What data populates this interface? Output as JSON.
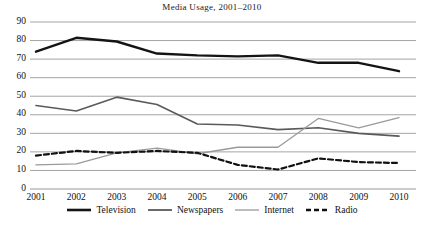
{
  "chart_data": {
    "type": "line",
    "title": "Media  Usage, 2001–2010",
    "xlabel": "",
    "ylabel": "",
    "x": [
      2001,
      2002,
      2003,
      2004,
      2005,
      2006,
      2007,
      2008,
      2009,
      2010
    ],
    "categories": [
      "2001",
      "2002",
      "2003",
      "2004",
      "2005",
      "2006",
      "2007",
      "2008",
      "2009",
      "2010"
    ],
    "xlim": [
      2001,
      2010
    ],
    "ylim": [
      0,
      90
    ],
    "yticks": [
      0,
      10,
      20,
      30,
      40,
      50,
      60,
      70,
      80,
      90
    ],
    "ytick_labels": [
      "0",
      "10",
      "20",
      "30",
      "40",
      "50",
      "60",
      "70",
      "80",
      "90"
    ],
    "grid": "horizontal",
    "legend_position": "bottom",
    "series": [
      {
        "name": "Television",
        "values": [
          74,
          81.5,
          79.5,
          73,
          72,
          71.5,
          72,
          68,
          68,
          63.5
        ],
        "color": "#141414",
        "width": 2.4,
        "dash": "none"
      },
      {
        "name": "Newspapers",
        "values": [
          45,
          42,
          49.5,
          45.5,
          35,
          34.5,
          32,
          33,
          30,
          28.5
        ],
        "color": "#5a5a5a",
        "width": 1.6,
        "dash": "none"
      },
      {
        "name": "Internet",
        "values": [
          13,
          13.5,
          19.5,
          22,
          19,
          22.5,
          22.5,
          38,
          33,
          38.5
        ],
        "color": "#9a9a9a",
        "width": 1.3,
        "dash": "none"
      },
      {
        "name": "Radio",
        "values": [
          18,
          20.5,
          19.5,
          20.5,
          19.5,
          13,
          10.5,
          16.5,
          14.5,
          14
        ],
        "color": "#111111",
        "width": 2.2,
        "dash": "5,3"
      }
    ]
  },
  "legend": {
    "items": [
      {
        "label": "Television"
      },
      {
        "label": "Newspapers"
      },
      {
        "label": "Internet"
      },
      {
        "label": "Radio"
      }
    ]
  },
  "axis_colors": {
    "gridline": "#8d8d8d",
    "axis": "#8d8d8d"
  }
}
